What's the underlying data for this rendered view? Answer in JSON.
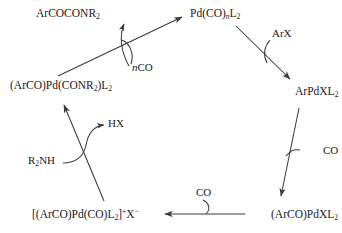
{
  "diagram": {
    "type": "catalytic-cycle",
    "direction": "clockwise",
    "background_color": "#ffffff",
    "line_color": "#3a3a3a",
    "text_color": "#1a1a1a",
    "nodes": [
      {
        "id": "diamide",
        "position": "top-left",
        "label_html": "ArCOCONR<sub>2</sub>",
        "label_text": "ArCOCONR2"
      },
      {
        "id": "pdco",
        "position": "top-right",
        "label_html": "Pd(CO)<sub class=\"ital\">n</sub>L<sub>2</sub>",
        "label_text": "Pd(CO)nL2"
      },
      {
        "id": "acylcarbamoyl",
        "position": "left",
        "label_html": "(ArCO)Pd(CONR<sub>2</sub>)L<sub>2</sub>",
        "label_text": "(ArCO)Pd(CONR2)L2"
      },
      {
        "id": "arpdxl2",
        "position": "right",
        "label_html": "ArPdXL<sub>2</sub>",
        "label_text": "ArPdXL2"
      },
      {
        "id": "cationic",
        "position": "bottom-left",
        "label_html": "[(ArCO)Pd(CO)L<sub>2</sub>]<sup>+</sup>X<sup>&#8722;</sup>",
        "label_text": "[(ArCO)Pd(CO)L2]+X-"
      },
      {
        "id": "acylpdxl2",
        "position": "bottom-right",
        "label_html": "(ArCO)PdXL<sub>2</sub>",
        "label_text": "(ArCO)PdXL2"
      }
    ],
    "reagents": [
      {
        "id": "nco",
        "label_html": "<span class=\"ital\">n</span>CO",
        "label_text": "nCO",
        "role": "incoming",
        "on_step": "acylcarbamoyl-to-pdco"
      },
      {
        "id": "arx",
        "label_html": "ArX",
        "label_text": "ArX",
        "role": "incoming",
        "on_step": "pdco-to-arpdxl2"
      },
      {
        "id": "hx",
        "label_html": "HX",
        "label_text": "HX",
        "role": "outgoing",
        "on_step": "cationic-to-acylcarbamoyl"
      },
      {
        "id": "r2nh",
        "label_html": "R<sub>2</sub>NH",
        "label_text": "R2NH",
        "role": "incoming",
        "on_step": "cationic-to-acylcarbamoyl"
      },
      {
        "id": "co-right",
        "label_html": "CO",
        "label_text": "CO",
        "role": "incoming",
        "on_step": "arpdxl2-to-acylpdxl2"
      },
      {
        "id": "co-bottom",
        "label_html": "CO",
        "label_text": "CO",
        "role": "incoming",
        "on_step": "acylpdxl2-to-cationic"
      }
    ],
    "arrows": [
      {
        "id": "acylcarbamoyl-to-pdco",
        "from": "acylcarbamoyl",
        "to": "pdco",
        "style": "straight"
      },
      {
        "id": "curved-to-diamide",
        "from": "cycle",
        "to": "diamide",
        "style": "curved-release"
      },
      {
        "id": "pdco-to-arpdxl2",
        "from": "pdco",
        "to": "arpdxl2",
        "style": "straight"
      },
      {
        "id": "arpdxl2-to-acylpdxl2",
        "from": "arpdxl2",
        "to": "acylpdxl2",
        "style": "straight"
      },
      {
        "id": "acylpdxl2-to-cationic",
        "from": "acylpdxl2",
        "to": "cationic",
        "style": "straight-horizontal"
      },
      {
        "id": "cationic-to-acylcarbamoyl",
        "from": "cationic",
        "to": "acylcarbamoyl",
        "style": "straight"
      },
      {
        "id": "r2nh-to-hx",
        "from": "r2nh",
        "to": "hx",
        "style": "curved-crossing"
      }
    ]
  }
}
